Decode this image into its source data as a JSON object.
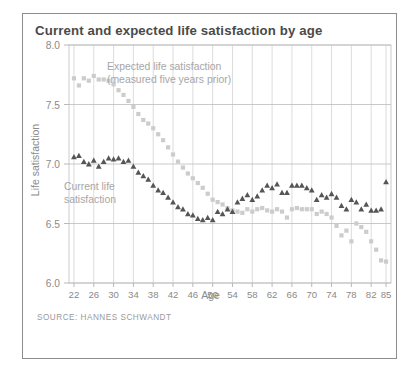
{
  "figure": {
    "title": "Current and expected life satisfaction by age",
    "source": "SOURCE: HANNES SCHWANDT",
    "frame_color": "#8d8d8d",
    "title_color": "#4a4a4a"
  },
  "annotations": {
    "expected": "Expected life satisfaction\n(measured five years prior)",
    "current": "Current life\nsatisfaction"
  },
  "chart_data": {
    "type": "scatter",
    "title": "Current and expected life satisfaction by age",
    "xlabel": "Age",
    "ylabel": "Life satisfaction",
    "xlim": [
      21,
      86
    ],
    "ylim": [
      6.0,
      8.0
    ],
    "xticks": [
      22,
      26,
      30,
      34,
      38,
      42,
      46,
      50,
      54,
      58,
      62,
      66,
      70,
      74,
      78,
      82,
      85
    ],
    "yticks": [
      6.0,
      6.5,
      7.0,
      7.5,
      8.0
    ],
    "ytick_labels": [
      "6.0",
      "6.5",
      "7.0",
      "7.5",
      "8.0"
    ],
    "grid": "vertical-and-horizontal",
    "legend": "none",
    "series": [
      {
        "name": "Expected life satisfaction (measured five years prior)",
        "marker": "square",
        "color": "#cccccc",
        "x": [
          22,
          23,
          24,
          25,
          26,
          27,
          28,
          29,
          30,
          31,
          32,
          33,
          34,
          35,
          36,
          37,
          38,
          39,
          40,
          41,
          42,
          43,
          44,
          45,
          46,
          47,
          48,
          49,
          50,
          51,
          52,
          53,
          54,
          55,
          56,
          57,
          58,
          59,
          60,
          61,
          62,
          63,
          64,
          65,
          66,
          67,
          68,
          69,
          70,
          71,
          72,
          73,
          74,
          75,
          76,
          77,
          78,
          79,
          80,
          81,
          82,
          83,
          84,
          85
        ],
        "y": [
          7.72,
          7.66,
          7.72,
          7.7,
          7.74,
          7.71,
          7.71,
          7.7,
          7.67,
          7.62,
          7.58,
          7.53,
          7.48,
          7.42,
          7.37,
          7.34,
          7.3,
          7.25,
          7.2,
          7.14,
          7.08,
          7.02,
          6.97,
          6.92,
          6.88,
          6.84,
          6.8,
          6.75,
          6.7,
          6.68,
          6.66,
          6.63,
          6.61,
          6.6,
          6.59,
          6.62,
          6.6,
          6.62,
          6.63,
          6.61,
          6.6,
          6.62,
          6.6,
          6.55,
          6.62,
          6.63,
          6.62,
          6.62,
          6.62,
          6.58,
          6.6,
          6.58,
          6.55,
          6.48,
          6.4,
          6.44,
          6.35,
          6.5,
          6.47,
          6.43,
          6.35,
          6.28,
          6.19,
          6.18
        ]
      },
      {
        "name": "Current life satisfaction",
        "marker": "triangle",
        "color": "#555555",
        "x": [
          22,
          23,
          24,
          25,
          26,
          27,
          28,
          29,
          30,
          31,
          32,
          33,
          34,
          35,
          36,
          37,
          38,
          39,
          40,
          41,
          42,
          43,
          44,
          45,
          46,
          47,
          48,
          49,
          50,
          51,
          52,
          53,
          54,
          55,
          56,
          57,
          58,
          59,
          60,
          61,
          62,
          63,
          64,
          65,
          66,
          67,
          68,
          69,
          70,
          71,
          72,
          73,
          74,
          75,
          76,
          77,
          78,
          79,
          80,
          81,
          82,
          83,
          84,
          85
        ],
        "y": [
          7.06,
          7.07,
          7.02,
          7.0,
          7.03,
          6.98,
          7.02,
          7.05,
          7.04,
          7.05,
          7.02,
          7.03,
          6.98,
          6.93,
          6.9,
          6.87,
          6.82,
          6.78,
          6.76,
          6.72,
          6.68,
          6.64,
          6.62,
          6.58,
          6.57,
          6.54,
          6.53,
          6.55,
          6.53,
          6.6,
          6.58,
          6.62,
          6.6,
          6.68,
          6.71,
          6.74,
          6.7,
          6.73,
          6.78,
          6.82,
          6.8,
          6.83,
          6.76,
          6.76,
          6.82,
          6.82,
          6.82,
          6.8,
          6.78,
          6.7,
          6.74,
          6.72,
          6.75,
          6.72,
          6.65,
          6.62,
          6.7,
          6.68,
          6.62,
          6.66,
          6.61,
          6.61,
          6.62,
          6.85
        ]
      }
    ]
  }
}
